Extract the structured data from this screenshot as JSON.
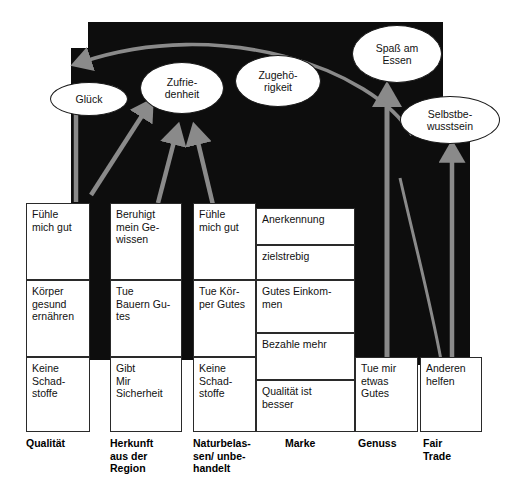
{
  "diagram": {
    "backdrop_color": "#0d0d0d",
    "arrow_color": "#8a8a8a",
    "box_fill": "#ffffff",
    "ellipse_fill": "#ffffff"
  },
  "values": [
    {
      "id": "glueck",
      "label": "Glück",
      "x": 50,
      "y": 82,
      "w": 78,
      "h": 34
    },
    {
      "id": "zufriedenheit",
      "label": "Zufrie-\ndenheit",
      "x": 140,
      "y": 62,
      "w": 84,
      "h": 52
    },
    {
      "id": "zugehoerigkeit",
      "label": "Zugehö-\nrigkeit",
      "x": 235,
      "y": 55,
      "w": 86,
      "h": 52
    },
    {
      "id": "spass",
      "label": "Spaß am\nEssen",
      "x": 352,
      "y": 25,
      "w": 90,
      "h": 58
    },
    {
      "id": "selbstbewusst",
      "label": "Selbstbe-\nwusstsein",
      "x": 400,
      "y": 96,
      "w": 100,
      "h": 48
    }
  ],
  "columns": [
    {
      "id": "qualitaet",
      "caption": "Qualität",
      "caption_x": 26,
      "caption_y": 437,
      "x": 26,
      "w": 64,
      "boxes": [
        {
          "text": "Fühle\nmich gut",
          "y": 203,
          "h": 77
        },
        {
          "text": "Körper\ngesund\nernähren",
          "y": 280,
          "h": 77
        },
        {
          "text": "Keine\nSchad-\nstoffe",
          "y": 357,
          "h": 75
        }
      ]
    },
    {
      "id": "herkunft",
      "caption": "Herkunft\naus der\nRegion",
      "caption_x": 110,
      "caption_y": 437,
      "x": 110,
      "w": 72,
      "boxes": [
        {
          "text": "Beruhigt\nmein Ge-\nwissen",
          "y": 203,
          "h": 77
        },
        {
          "text": "Tue\nBauern Gu-\ntes",
          "y": 280,
          "h": 77
        },
        {
          "text": "Gibt\nMir\nSicherheit",
          "y": 357,
          "h": 75
        }
      ]
    },
    {
      "id": "naturbelassen",
      "caption": "Naturbelas-\nsen/ unbe-\nhandelt",
      "caption_x": 193,
      "caption_y": 437,
      "x": 193,
      "w": 63,
      "boxes": [
        {
          "text": "Fühle\nmich gut",
          "y": 203,
          "h": 77
        },
        {
          "text": "Tue Kör-\nper Gutes",
          "y": 280,
          "h": 77
        },
        {
          "text": "Keine\nSchad-\nstoffe",
          "y": 357,
          "h": 75
        }
      ]
    },
    {
      "id": "marke",
      "caption": "Marke",
      "caption_x": 285,
      "caption_y": 437,
      "x": 256,
      "w": 99,
      "boxes": [
        {
          "text": "Anerkennung",
          "y": 208,
          "h": 37
        },
        {
          "text": "zielstrebig",
          "y": 245,
          "h": 35
        },
        {
          "text": "Gutes Einkom-\nmen",
          "y": 280,
          "h": 53
        },
        {
          "text": "Bezahle mehr",
          "y": 333,
          "h": 47
        },
        {
          "text": "Qualität ist\nbesser",
          "y": 380,
          "h": 52
        }
      ]
    },
    {
      "id": "genuss",
      "caption": "Genuss",
      "caption_x": 358,
      "caption_y": 437,
      "x": 355,
      "w": 63,
      "boxes": [
        {
          "text": "Tue mir\netwas\nGutes",
          "y": 357,
          "h": 75
        }
      ]
    },
    {
      "id": "fairtrade",
      "caption": "Fair\nTrade",
      "caption_x": 423,
      "caption_y": 437,
      "x": 420,
      "w": 62,
      "boxes": [
        {
          "text": "Anderen\nhelfen",
          "y": 357,
          "h": 75
        }
      ]
    }
  ]
}
